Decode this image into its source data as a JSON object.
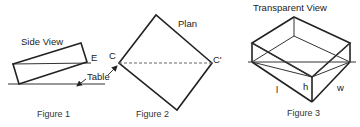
{
  "figure1": {
    "title": "Side View",
    "edge_label": "E",
    "table_label": "Table",
    "caption": "Figure 1"
  },
  "figure2": {
    "title": "Plan",
    "corner_left_label": "C",
    "corner_right_label": "C'",
    "caption": "Figure 2"
  },
  "figure3": {
    "title": "Transparent View",
    "length_label": "l",
    "height_label": "h",
    "width_label": "w",
    "caption": "Figure 3"
  }
}
